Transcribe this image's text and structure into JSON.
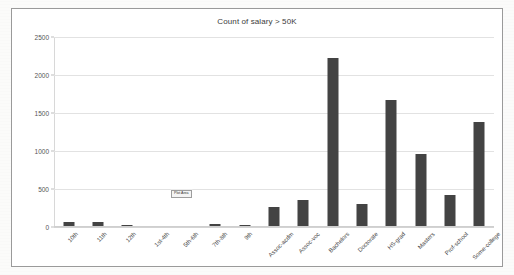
{
  "chart_data": {
    "type": "bar",
    "title": "Count of salary > 50K",
    "xlabel": "",
    "ylabel": "",
    "ylim": [
      0,
      2500
    ],
    "yticks": [
      0,
      500,
      1000,
      1500,
      2000,
      2500
    ],
    "grid": true,
    "legend": "none",
    "bar_color": "#434343",
    "categories": [
      "10th",
      "11th",
      "12th",
      "1st-4th",
      "5th-6th",
      "7th-8th",
      "9th",
      "Assoc-acdm",
      "Assoc-voc",
      "Bachelors",
      "Doctorate",
      "HS-grad",
      "Masters",
      "Prof-school",
      "Some-college"
    ],
    "values": [
      62,
      60,
      33,
      6,
      16,
      40,
      27,
      265,
      361,
      2221,
      306,
      1675,
      959,
      423,
      1387
    ]
  },
  "overlay": {
    "plot_area_tooltip": "Plot Area"
  },
  "page": {
    "ghost_line_1": "stsoh olse hed stasrre",
    "ghost_line_2": "osne olyse tasr hed - berssatt"
  }
}
